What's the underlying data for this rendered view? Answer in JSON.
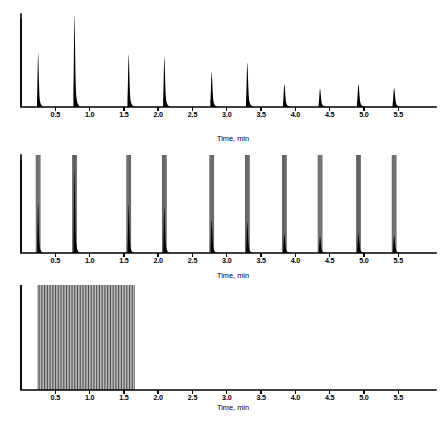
{
  "figure": {
    "title": "",
    "panel_count": 3,
    "background_color": "#ffffff",
    "trace_color": "#000000"
  },
  "axis": {
    "xlabel": "Time, min",
    "tick_labels": [
      "0.5",
      "1.0",
      "1.5",
      "2.0",
      "2.5",
      "3.0",
      "3.5",
      "4.0",
      "4.5",
      "5.0",
      "5.5"
    ],
    "tick_values": [
      0.5,
      1.0,
      1.5,
      2.0,
      2.5,
      3.0,
      3.5,
      4.0,
      4.5,
      5.0,
      5.5
    ],
    "xlim": [
      0.0,
      6.05
    ],
    "ylabel": "",
    "grid": false
  },
  "chart_data": {
    "type": "line",
    "title": "",
    "xlabel": "Time, min",
    "ylabel": "Detector response",
    "xlim": [
      0.0,
      6.05
    ],
    "ylim": [
      0,
      100
    ],
    "grid": false,
    "legend": "none",
    "panels": [
      {
        "name": "panel-a-single-column",
        "index": 0,
        "description": "Baseline separation: ten well resolved sharp peaks plus solvent front",
        "solvent_front": {
          "time": 0.0,
          "height": 95
        },
        "series": [
          {
            "name": "chromatogram-a",
            "x": [
              0.25,
              0.78,
              1.57,
              2.09,
              2.78,
              3.3,
              3.84,
              4.36,
              4.92,
              5.44
            ],
            "values": [
              58,
              100,
              57,
              55,
              38,
              48,
              25,
              20,
              25,
              21
            ],
            "widths": [
              0.022,
              0.022,
              0.024,
              0.024,
              0.026,
              0.026,
              0.028,
              0.028,
              0.03,
              0.03
            ]
          }
        ]
      },
      {
        "name": "panel-b-two-columns",
        "index": 1,
        "description": "Each analyte band split into a cluster of tall narrow lines overlaying the short solid peak",
        "solvent_front": {
          "time": 0.0,
          "height": 95
        },
        "series": [
          {
            "name": "chromatogram-b-solid-peaks",
            "x": [
              0.25,
              0.78,
              1.57,
              2.09,
              2.78,
              3.3,
              3.84,
              4.36,
              4.92,
              5.44
            ],
            "values": [
              52,
              86,
              50,
              48,
              34,
              32,
              20,
              17,
              20,
              18
            ],
            "widths": [
              0.02,
              0.02,
              0.022,
              0.022,
              0.024,
              0.024,
              0.026,
              0.026,
              0.028,
              0.028
            ]
          },
          {
            "name": "chromatogram-b-clusters",
            "x": [
              0.25,
              0.78,
              1.57,
              2.09,
              2.78,
              3.3,
              3.84,
              4.36,
              4.92,
              5.44
            ],
            "values": [
              100,
              100,
              100,
              100,
              100,
              100,
              100,
              100,
              100,
              100
            ],
            "lines_per_cluster": 5,
            "cluster_span": 0.055
          }
        ]
      },
      {
        "name": "panel-c-many-columns",
        "index": 2,
        "description": "Fully unresolved dense band of peaks eluting between 0.25 and 1.65 min",
        "solvent_front": {
          "time": 0.0,
          "height": 100
        },
        "series": [
          {
            "name": "chromatogram-c-dense-band",
            "x_start": 0.25,
            "x_end": 1.65,
            "line_count": 62,
            "values": [
              100
            ],
            "note": "all lines clipped at panel top"
          }
        ]
      }
    ]
  }
}
